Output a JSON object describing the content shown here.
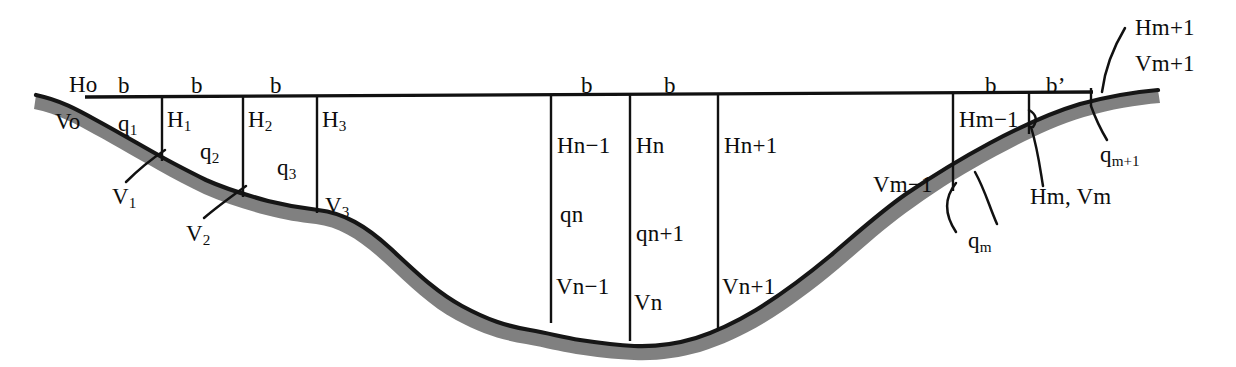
{
  "diagram": {
    "colors": {
      "line": "#111111",
      "terrain_outline": "#161616",
      "terrain_fill": "#808080",
      "background": "#ffffff",
      "text": "#0d0d0d"
    },
    "top_width_labels": [
      {
        "id": "b-1",
        "text": "b",
        "x": 118,
        "y": 74
      },
      {
        "id": "b-2",
        "text": "b",
        "x": 191,
        "y": 74
      },
      {
        "id": "b-3",
        "text": "b",
        "x": 270,
        "y": 74
      },
      {
        "id": "b-4",
        "text": "b",
        "x": 581,
        "y": 74
      },
      {
        "id": "b-5",
        "text": "b",
        "x": 664,
        "y": 74
      },
      {
        "id": "b-6",
        "text": "b",
        "x": 985,
        "y": 74
      },
      {
        "id": "b-prime",
        "text": "b’",
        "x": 1046,
        "y": 74
      }
    ],
    "depth_labels": [
      {
        "id": "Ho",
        "text": "Ho",
        "x": 69,
        "y": 73
      },
      {
        "id": "H1",
        "text": "H",
        "sub": "1",
        "x": 167,
        "y": 108
      },
      {
        "id": "H2",
        "text": "H",
        "sub": "2",
        "x": 248,
        "y": 108
      },
      {
        "id": "H3",
        "text": "H",
        "sub": "3",
        "x": 322,
        "y": 108
      },
      {
        "id": "Hn-1",
        "text": "Hn−1",
        "x": 557,
        "y": 134
      },
      {
        "id": "Hn",
        "text": "Hn",
        "x": 636,
        "y": 134
      },
      {
        "id": "Hn+1",
        "text": "Hn+1",
        "x": 724,
        "y": 134
      },
      {
        "id": "Hm-1",
        "text": "Hm−1",
        "x": 959,
        "y": 108
      },
      {
        "id": "Hm+1",
        "text": "Hm+1",
        "x": 1135,
        "y": 16
      }
    ],
    "velocity_labels": [
      {
        "id": "Vo",
        "text": "Vo",
        "x": 55,
        "y": 110
      },
      {
        "id": "V1",
        "text": "V",
        "sub": "1",
        "x": 112,
        "y": 185
      },
      {
        "id": "V2",
        "text": "V",
        "sub": "2",
        "x": 186,
        "y": 222
      },
      {
        "id": "V3",
        "text": "V",
        "sub": "3",
        "x": 325,
        "y": 194
      },
      {
        "id": "Vn-1",
        "text": "Vn−1",
        "x": 556,
        "y": 275
      },
      {
        "id": "Vn",
        "text": "Vn",
        "x": 634,
        "y": 291
      },
      {
        "id": "Vn+1",
        "text": "Vn+1",
        "x": 722,
        "y": 275
      },
      {
        "id": "Vm-1",
        "text": "Vm−1",
        "x": 873,
        "y": 173
      },
      {
        "id": "Vm+1",
        "text": "Vm+1",
        "x": 1135,
        "y": 52
      }
    ],
    "discharge_labels": [
      {
        "id": "q1",
        "text": "q",
        "sub": "1",
        "x": 118,
        "y": 112
      },
      {
        "id": "q2",
        "text": "q",
        "sub": "2",
        "x": 200,
        "y": 140
      },
      {
        "id": "q3",
        "text": "q",
        "sub": "3",
        "x": 277,
        "y": 156
      },
      {
        "id": "qn",
        "text": "qn",
        "x": 560,
        "y": 203
      },
      {
        "id": "qn+1",
        "text": "qn+1",
        "x": 636,
        "y": 222
      },
      {
        "id": "qm",
        "text": "q",
        "sub": "m",
        "x": 968,
        "y": 229
      },
      {
        "id": "qm+1",
        "text": "q",
        "sub": "m+1",
        "x": 1100,
        "y": 143
      }
    ],
    "combined_labels": [
      {
        "id": "Hm-Vm",
        "text": "Hm, Vm",
        "x": 1030,
        "y": 185
      }
    ],
    "verticals": [
      {
        "id": "vline-1",
        "x": 162,
        "y_top": 97,
        "y_bottom": 160
      },
      {
        "id": "vline-2",
        "x": 243,
        "y_top": 97,
        "y_bottom": 196
      },
      {
        "id": "vline-3",
        "x": 317,
        "y_top": 97,
        "y_bottom": 212
      },
      {
        "id": "vline-4",
        "x": 551,
        "y_top": 97,
        "y_bottom": 322
      },
      {
        "id": "vline-5",
        "x": 630,
        "y_top": 97,
        "y_bottom": 339
      },
      {
        "id": "vline-6",
        "x": 718,
        "y_top": 97,
        "y_bottom": 329
      },
      {
        "id": "vline-7",
        "x": 953,
        "y_top": 97,
        "y_bottom": 190
      },
      {
        "id": "vline-8",
        "x": 1029,
        "y_top": 97,
        "y_bottom": 133
      },
      {
        "id": "vline-9",
        "x": 1091,
        "y_top": 90,
        "y_bottom": 105
      }
    ],
    "water_surface": {
      "id": "water-surface-line",
      "x1": 85,
      "y1": 97,
      "x2": 1093,
      "y2": 92
    }
  }
}
